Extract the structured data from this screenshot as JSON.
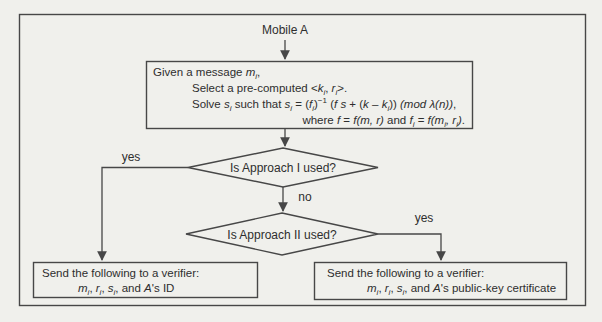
{
  "colors": {
    "line": "#474747",
    "text": "#2e2e2e",
    "background": "#f0f0ec"
  },
  "nodes": {
    "start": {
      "label": "Mobile A"
    },
    "process": {
      "lines_html": [
        "Given a message <i>m<sub>i</sub></i>,",
        "Select a pre-computed &lt;<i>k<sub>i</sub></i>, <i>r<sub>i</sub></i>&gt;.",
        "Solve <i>s<sub>i</sub></i> such that <i>s<sub>i</sub></i> = (<i>f<sub>i</sub></i>)<sup>−1</sup> (<i>f s</i> + (<i>k</i> – <i>k<sub>i</sub></i>)) <i>(mod λ(n))</i>,",
        "where <i>f</i> = <i>f(m, r)</i> and <i>f<sub>i</sub></i> = <i>f(m<sub>i</sub>, r<sub>i</sub>)</i>."
      ]
    },
    "decision1": {
      "question": "Is Approach I used?",
      "yes_label": "yes",
      "no_label": "no"
    },
    "decision2": {
      "question": "Is Approach II used?",
      "yes_label": "yes"
    },
    "left_output": {
      "line1": "Send the following to a verifier:",
      "line2_html": "<i>m<sub>i</sub></i>, <i>r<sub>i</sub></i>, <i>s<sub>i</sub></i>, and <i>A</i>'s ID"
    },
    "right_output": {
      "line1": "Send the following to a verifier:",
      "line2_html": "<i>m<sub>i</sub></i>, <i>r<sub>i</sub></i>, <i>s<sub>i</sub></i>, and <i>A</i>'s public-key certificate"
    }
  }
}
